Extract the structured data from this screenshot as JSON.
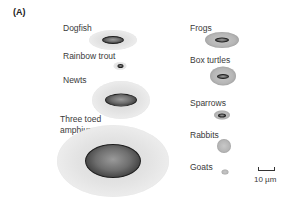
{
  "panel": {
    "label": "(A)"
  },
  "species": [
    {
      "name": "Dogfish",
      "label_lines": [
        "Dogfish"
      ],
      "label_pos": [
        63,
        23
      ],
      "cell": {
        "cx": 113,
        "cy": 40,
        "w": 48,
        "h": 20,
        "nucleus_w": 22,
        "nucleus_h": 8,
        "style": "light"
      }
    },
    {
      "name": "Rainbow trout",
      "label_lines": [
        "Rainbow trout"
      ],
      "label_pos": [
        63,
        51
      ],
      "cell": {
        "cx": 120,
        "cy": 66,
        "w": 13,
        "h": 8,
        "nucleus_w": 6,
        "nucleus_h": 4,
        "style": "light"
      }
    },
    {
      "name": "Newts",
      "label_lines": [
        "Newts"
      ],
      "label_pos": [
        63,
        75
      ],
      "cell": {
        "cx": 121,
        "cy": 100,
        "w": 58,
        "h": 38,
        "nucleus_w": 32,
        "nucleus_h": 13,
        "style": "light"
      }
    },
    {
      "name": "Three toed amphiumas",
      "label_lines": [
        "Three toed",
        "amphiumas"
      ],
      "label_pos": [
        60,
        114
      ],
      "cell": {
        "cx": 113,
        "cy": 161,
        "w": 112,
        "h": 72,
        "nucleus_w": 56,
        "nucleus_h": 34,
        "style": "light"
      }
    },
    {
      "name": "Frogs",
      "label_lines": [
        "Frogs"
      ],
      "label_pos": [
        190,
        23
      ],
      "cell": {
        "cx": 222,
        "cy": 40,
        "w": 34,
        "h": 16,
        "nucleus_w": 14,
        "nucleus_h": 5,
        "style": "dark"
      }
    },
    {
      "name": "Box turtles",
      "label_lines": [
        "Box turtles"
      ],
      "label_pos": [
        190,
        55
      ],
      "cell": {
        "cx": 223,
        "cy": 76,
        "w": 26,
        "h": 19,
        "nucleus_w": 12,
        "nucleus_h": 5,
        "style": "dark"
      }
    },
    {
      "name": "Sparrows",
      "label_lines": [
        "Sparrows"
      ],
      "label_pos": [
        190,
        98
      ],
      "cell": {
        "cx": 222,
        "cy": 115,
        "w": 16,
        "h": 9,
        "nucleus_w": 8,
        "nucleus_h": 4,
        "style": "dark"
      }
    },
    {
      "name": "Rabbits",
      "label_lines": [
        "Rabbits"
      ],
      "label_pos": [
        190,
        130
      ],
      "cell": {
        "cx": 224,
        "cy": 146,
        "w": 14,
        "h": 14,
        "nucleus_w": 0,
        "nucleus_h": 0,
        "style": "dark"
      }
    },
    {
      "name": "Goats",
      "label_lines": [
        "Goats"
      ],
      "label_pos": [
        190,
        162
      ],
      "cell": {
        "cx": 225,
        "cy": 172,
        "w": 7,
        "h": 5,
        "nucleus_w": 0,
        "nucleus_h": 0,
        "style": "dark"
      }
    }
  ],
  "scale_bar": {
    "label": "10 µm",
    "length_px": 16
  }
}
